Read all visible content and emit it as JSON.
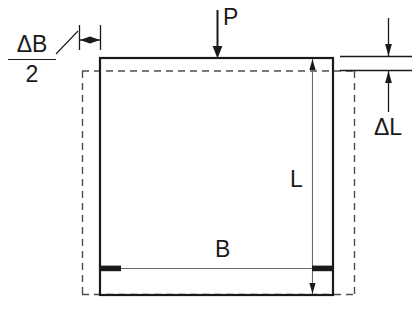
{
  "diagram": {
    "canvas": {
      "width": 417,
      "height": 309
    },
    "colors": {
      "line": "#1a1a1a",
      "thin_line": "#555555",
      "dashed_line": "#4d4d4d",
      "background": "#ffffff"
    },
    "labels": {
      "load": "P",
      "length": "L",
      "breadth": "B",
      "delta_length": "ΔL",
      "delta_breadth_numerator": "ΔB",
      "delta_breadth_denominator": "2"
    },
    "geometry": {
      "deformed_outline": {
        "x1": 100,
        "y1": 58,
        "x2": 333,
        "y2": 295
      },
      "original_outline": {
        "x1": 82,
        "y1": 71,
        "x2": 355,
        "y2": 295
      },
      "load_arrow": {
        "x": 217,
        "y_start": 10,
        "y_end": 58
      },
      "delta_b_dimension": {
        "x1": 79,
        "x2": 100,
        "y": 40
      },
      "delta_l_dimension": {
        "x": 388,
        "y1": 56,
        "y2": 71
      },
      "length_dimension": {
        "x": 312,
        "y1": 58,
        "y2": 295
      },
      "breadth_dimension": {
        "y": 268,
        "x1": 100,
        "x2": 333
      }
    }
  }
}
